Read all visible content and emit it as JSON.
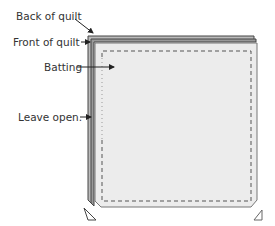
{
  "labels": {
    "back": "Back of quilt",
    "front": "Front of quilt",
    "batting": "Batting",
    "leave_open": "Leave open."
  },
  "colors": {
    "fill": "#ececec",
    "outline": "#444444",
    "stitch": "#555555"
  }
}
